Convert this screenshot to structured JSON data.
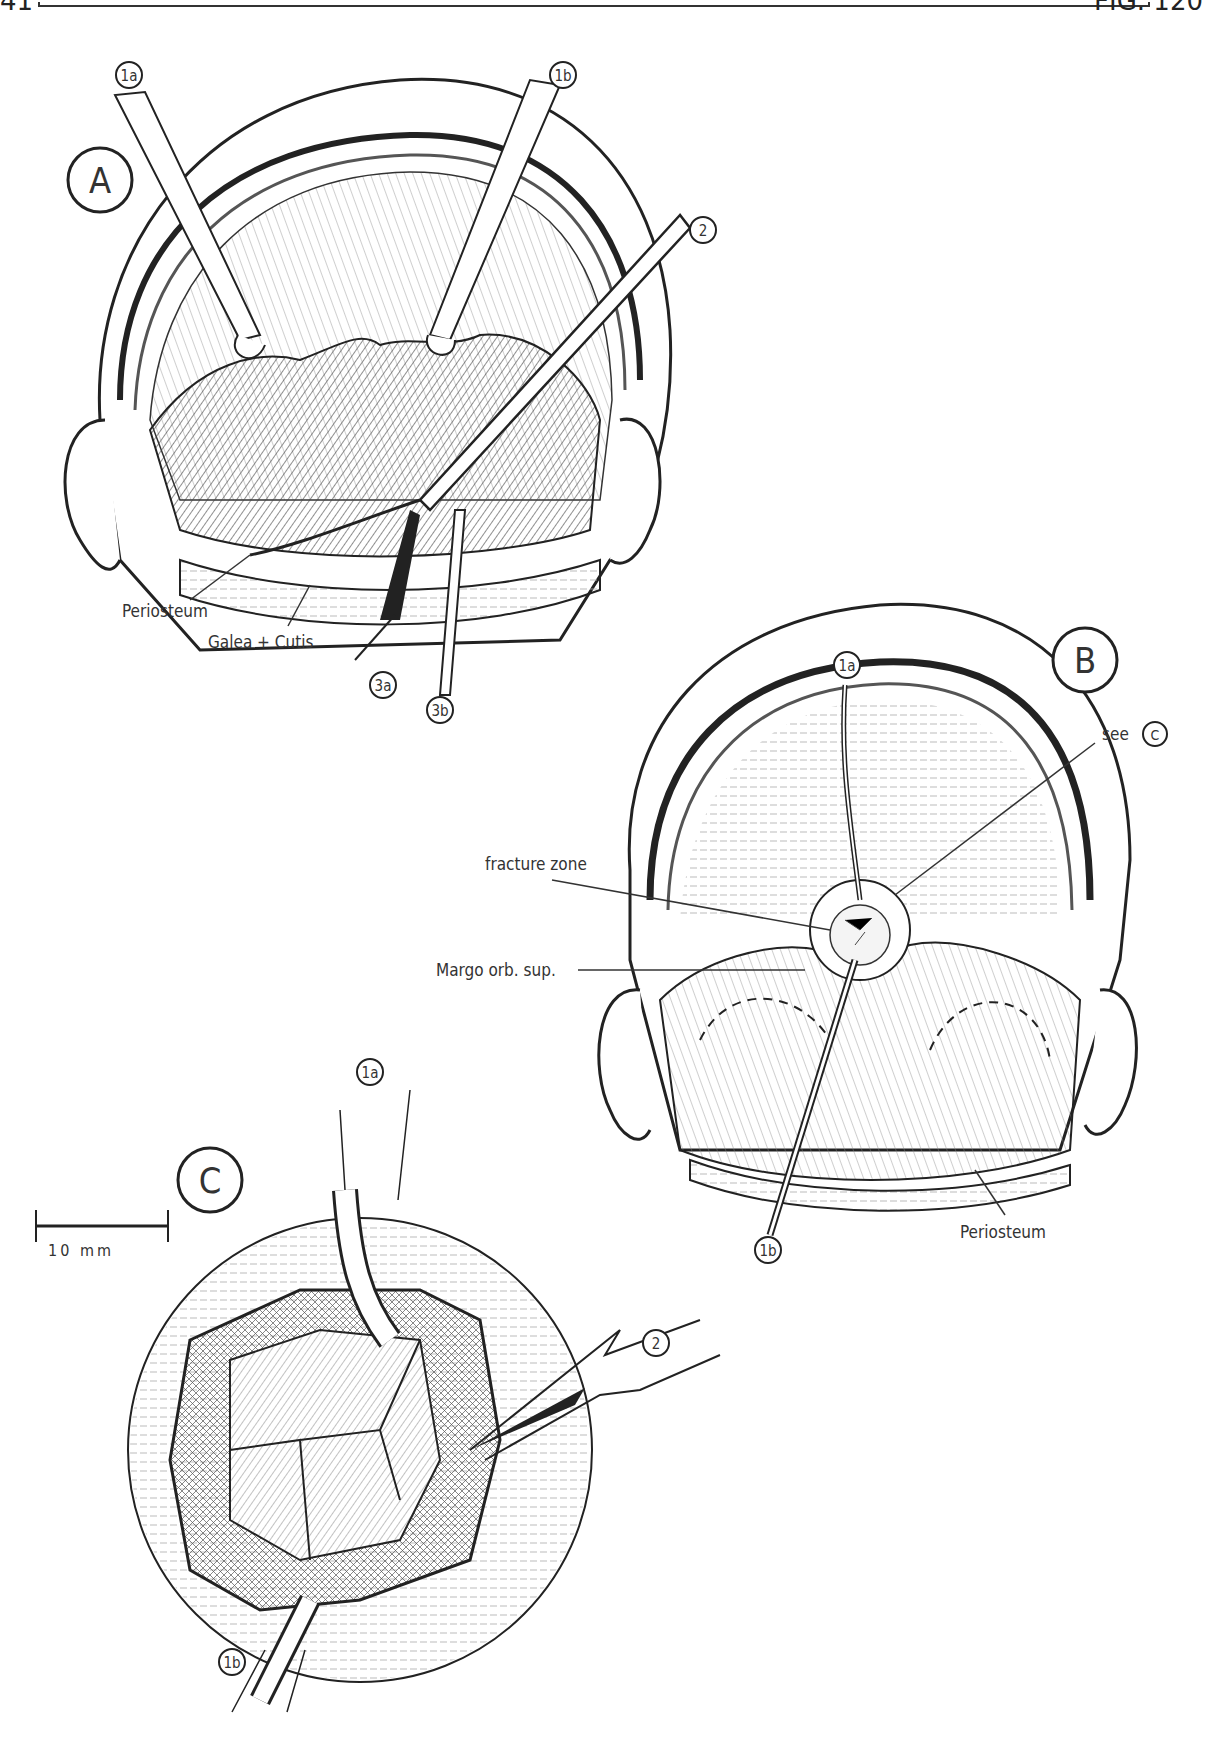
{
  "header": {
    "page_number": "41",
    "figure_number": "FIG. 120"
  },
  "panels": [
    {
      "id": "A",
      "label": "A",
      "callouts": [
        "1a",
        "1b",
        "2",
        "3a",
        "3b"
      ],
      "annotations": [
        "Periosteum",
        "Galea + Cutis"
      ]
    },
    {
      "id": "B",
      "label": "B",
      "callouts": [
        "1a",
        "1b"
      ],
      "annotations": [
        "see",
        "C",
        "fracture zone",
        "Margo orb. sup.",
        "Periosteum"
      ]
    },
    {
      "id": "C",
      "label": "C",
      "callouts": [
        "1a",
        "1b",
        "2"
      ],
      "annotations": [
        "10 mm"
      ]
    }
  ],
  "scale_bar": {
    "label": "10 mm"
  },
  "colors": {
    "ink": "#222222",
    "paper": "#ffffff",
    "hatch": "#555555"
  }
}
